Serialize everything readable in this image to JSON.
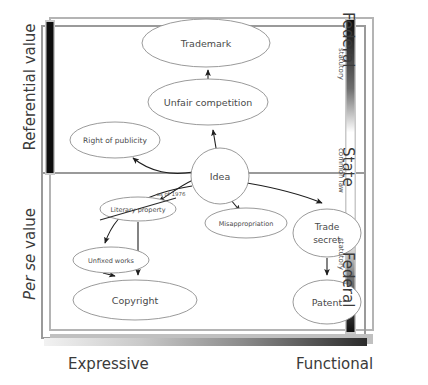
{
  "figure": {
    "background": "#ffffff"
  },
  "axes": {
    "vertical_left": {
      "upper_label": "Referential value",
      "lower_label_italic": "Per se",
      "lower_label_roman": " value",
      "bar_color": "#111111"
    },
    "horizontal_bottom": {
      "left_label": "Expressive",
      "right_label": "Functional",
      "gradient_from": "#ffffff",
      "gradient_to": "#2b2b2b"
    },
    "vertical_right": {
      "top_label": "Federal",
      "middle_label": "State",
      "bottom_label": "Federal",
      "minor_top": "statutory",
      "minor_middle": "common law",
      "minor_bottom": "statutory",
      "gradient_stops": [
        "#0d0d0d",
        "#b8b8b8",
        "#ffffff",
        "#d8d8d8",
        "#141414"
      ]
    }
  },
  "nodes": [
    {
      "id": "trademark",
      "label": "Trademark",
      "shape": "ellipse",
      "cx": 206,
      "cy": 43,
      "rx": 64,
      "ry": 24,
      "font_size": 9.5,
      "strikethrough": false
    },
    {
      "id": "unfair",
      "label": "Unfair competition",
      "shape": "ellipse",
      "cx": 208,
      "cy": 102,
      "rx": 60,
      "ry": 23,
      "font_size": 9.5,
      "strikethrough": false
    },
    {
      "id": "right-of-publicity",
      "label": "Right of publicity",
      "shape": "ellipse",
      "cx": 115,
      "cy": 140,
      "rx": 45,
      "ry": 18,
      "font_size": 7.5,
      "strikethrough": false
    },
    {
      "id": "idea",
      "label": "Idea",
      "shape": "circle",
      "cx": 220,
      "cy": 176,
      "rx": 29,
      "ry": 28,
      "font_size": 9.5,
      "strikethrough": false
    },
    {
      "id": "literary-property",
      "label": "Literary property",
      "shape": "ellipse",
      "cx": 138,
      "cy": 209,
      "rx": 38,
      "ry": 12,
      "font_size": 6.5,
      "strikethrough": true
    },
    {
      "id": "misappropriation",
      "label": "Misappropriation",
      "shape": "ellipse",
      "cx": 246,
      "cy": 223,
      "rx": 41,
      "ry": 15,
      "font_size": 6.5,
      "strikethrough": false
    },
    {
      "id": "trade-secret",
      "label": "Trade\nsecret",
      "shape": "ellipse",
      "cx": 327,
      "cy": 233,
      "rx": 34,
      "ry": 24,
      "font_size": 9,
      "strikethrough": false
    },
    {
      "id": "unfixed-works",
      "label": "Unfixed works",
      "shape": "ellipse",
      "cx": 111,
      "cy": 260,
      "rx": 38,
      "ry": 13,
      "font_size": 6.5,
      "strikethrough": false
    },
    {
      "id": "copyright",
      "label": "Copyright",
      "shape": "ellipse",
      "cx": 135,
      "cy": 300,
      "rx": 62,
      "ry": 20,
      "font_size": 9.5,
      "strikethrough": false
    },
    {
      "id": "patent",
      "label": "Patent",
      "shape": "ellipse",
      "cx": 327,
      "cy": 302,
      "rx": 34,
      "ry": 22,
      "font_size": 9.5,
      "strikethrough": false
    }
  ],
  "edges": [
    {
      "id": "unfair-to-trademark",
      "from": "unfair",
      "to": "trademark",
      "note": ""
    },
    {
      "id": "idea-to-unfair",
      "from": "idea",
      "to": "unfair",
      "note": ""
    },
    {
      "id": "idea-to-right-of-publicity",
      "from": "idea",
      "to": "right-of-publicity",
      "note": ""
    },
    {
      "id": "idea-to-literary-property",
      "from": "idea",
      "to": "literary-property",
      "note": "as of 1976"
    },
    {
      "id": "idea-to-misappropriation",
      "from": "idea",
      "to": "misappropriation",
      "note": ""
    },
    {
      "id": "idea-to-trade-secret",
      "from": "idea",
      "to": "trade-secret",
      "note": ""
    },
    {
      "id": "idea-to-unfixed-works",
      "from": "idea",
      "to": "unfixed-works",
      "note": ""
    },
    {
      "id": "literary-to-copyright",
      "from": "literary-property",
      "to": "copyright",
      "note": ""
    },
    {
      "id": "unfixed-to-copyright",
      "from": "unfixed-works",
      "to": "copyright",
      "note": ""
    },
    {
      "id": "trade-secret-to-patent",
      "from": "trade-secret",
      "to": "patent",
      "note": ""
    }
  ],
  "annotations": {
    "as_of_1976": "as of 1976"
  },
  "colors": {
    "node_stroke": "#8e8e8e",
    "node_fill": "#ffffff",
    "edge_stroke": "#222222",
    "frame_stroke": "#9a9a9a",
    "divider": "#9a9a9a",
    "text": "#4a4a4a"
  }
}
